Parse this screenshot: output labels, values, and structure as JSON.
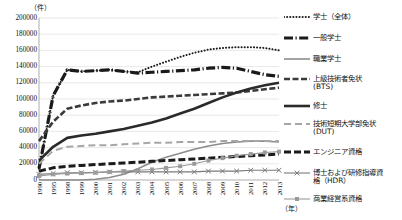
{
  "chart_data": {
    "type": "line",
    "title": "",
    "xlabel": "年",
    "ylabel": "件",
    "ylim": [
      0,
      200000
    ],
    "ytick_step": 20000,
    "grid": true,
    "legend_position": "right",
    "categories": [
      "1990",
      "1995",
      "1998",
      "1999",
      "2000",
      "2001",
      "2002",
      "2003",
      "2004",
      "2005",
      "2006",
      "2007",
      "2008",
      "2009",
      "2010",
      "2011",
      "2012",
      "2013"
    ],
    "yticks": [
      "0",
      "20000",
      "40000",
      "60000",
      "80000",
      "100000",
      "120000",
      "140000",
      "160000",
      "180000",
      "200000"
    ],
    "series": [
      {
        "name": "学士（全体）",
        "style": "dotted",
        "color": "#1a1a1a",
        "values": [
          14000,
          104000,
          136000,
          134000,
          135000,
          136000,
          134000,
          133000,
          140000,
          146000,
          152000,
          157000,
          161000,
          163000,
          164000,
          164000,
          163000,
          160000
        ]
      },
      {
        "name": "一般学士",
        "style": "thick-dash-dot",
        "color": "#1a1a1a",
        "values": [
          14000,
          104000,
          136000,
          134000,
          135000,
          136000,
          134000,
          132000,
          133000,
          134000,
          135000,
          136000,
          138000,
          139000,
          138000,
          134000,
          130000,
          128000
        ]
      },
      {
        "name": "職業学士",
        "style": "thin-gray-solid",
        "color": "#8c8c8c",
        "values": [
          0,
          0,
          0,
          0,
          1000,
          3000,
          7000,
          14000,
          22000,
          28000,
          33000,
          38000,
          42000,
          45000,
          47000,
          48000,
          48000,
          47000
        ]
      },
      {
        "name": "上級技術者免状(BTS)",
        "style": "dashed-medium",
        "color": "#3a3a3a",
        "values": [
          48000,
          72000,
          88000,
          92000,
          95000,
          97000,
          98000,
          100000,
          102000,
          103000,
          104000,
          105000,
          106000,
          107000,
          108000,
          110000,
          112000,
          114000
        ]
      },
      {
        "name": "修士",
        "style": "thick-solid",
        "color": "#2a2a2a",
        "values": [
          24000,
          41000,
          52000,
          55000,
          57000,
          60000,
          63000,
          67000,
          71000,
          76000,
          82000,
          88000,
          95000,
          102000,
          108000,
          113000,
          117000,
          120000
        ]
      },
      {
        "name": "技術短期大学部免状(DUT)",
        "style": "long-dash-gray",
        "color": "#a6a6a6",
        "values": [
          20000,
          36000,
          41000,
          42000,
          43000,
          43000,
          44000,
          45000,
          46000,
          46000,
          47000,
          47000,
          47000,
          48000,
          48000,
          48000,
          48000,
          48000
        ]
      },
      {
        "name": "エンジニア資格",
        "style": "thick-dash",
        "color": "#1a1a1a",
        "values": [
          11000,
          15000,
          17000,
          18000,
          19000,
          20000,
          21000,
          22000,
          23000,
          24000,
          25000,
          26000,
          27000,
          28000,
          29000,
          30000,
          31000,
          32000
        ]
      },
      {
        "name": "博士および研修指導資格(HDR)",
        "style": "x-marker",
        "color": "#7a7a7a",
        "values": [
          7000,
          8000,
          9000,
          9000,
          9500,
          10000,
          10000,
          10000,
          10000,
          10000,
          10000,
          10000,
          11000,
          11000,
          11000,
          12000,
          12000,
          12000
        ]
      },
      {
        "name": "商業経営系資格",
        "style": "square-marker",
        "color": "#9a9a9a",
        "values": [
          5000,
          7000,
          8000,
          8500,
          9000,
          10000,
          11000,
          12000,
          13000,
          15000,
          17000,
          20000,
          24000,
          27000,
          30000,
          32000,
          34000,
          35000
        ]
      }
    ]
  },
  "axes": {
    "y_unit": "（件）",
    "x_unit": "（年）"
  },
  "legend": {
    "items": [
      {
        "label": "学士（全体）"
      },
      {
        "label": "一般学士"
      },
      {
        "label": "職業学士"
      },
      {
        "label": "上級技術者免状\n(BTS)"
      },
      {
        "label": "修士"
      },
      {
        "label": "技術短期大学部免状\n(DUT)"
      },
      {
        "label": "エンジニア資格"
      },
      {
        "label": "博士および研修指導資\n格（HDR）"
      },
      {
        "label": "商業経営系資格"
      }
    ]
  }
}
